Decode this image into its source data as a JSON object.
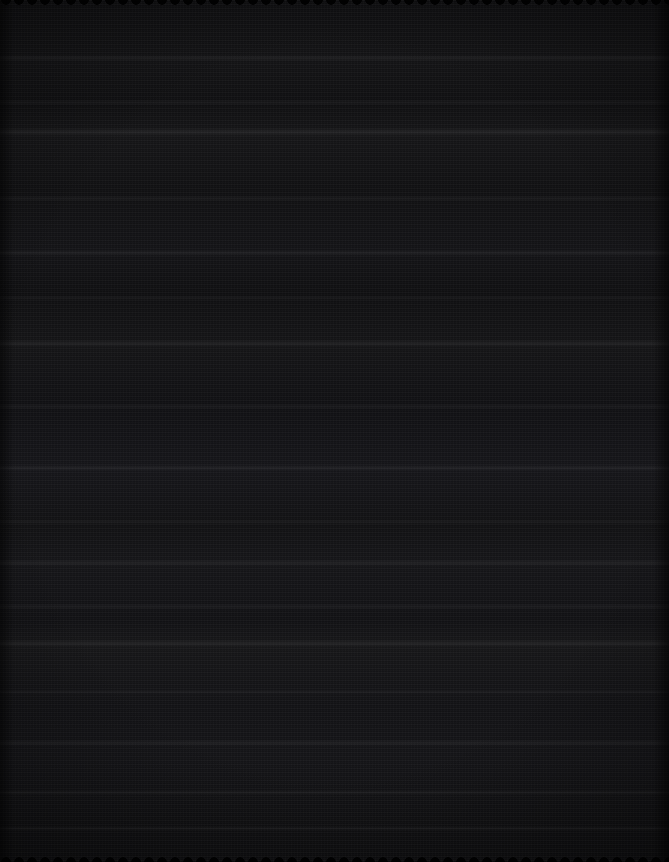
{
  "canvas": {
    "width": 669,
    "height": 862,
    "description": "Near-black scanned surface with horizontal scanline texture",
    "base_color": "#111113",
    "darkest_color": "#0d0d0e",
    "lightest_color": "#1a1a1e",
    "content_text": "",
    "legible_content": "none"
  },
  "texture": {
    "type": "horizontal-scanline-noise",
    "scanline_period_px": 2,
    "vertical_grain_period_px": 3
  },
  "bands": [
    {
      "name": "band-1",
      "top": 55,
      "height": 6,
      "opacity": 0.05
    },
    {
      "name": "band-2",
      "top": 100,
      "height": 5,
      "opacity": 0.04
    },
    {
      "name": "band-3",
      "top": 128,
      "height": 8,
      "opacity": 0.06
    },
    {
      "name": "band-4",
      "top": 196,
      "height": 5,
      "opacity": 0.04
    },
    {
      "name": "band-5",
      "top": 250,
      "height": 6,
      "opacity": 0.05
    },
    {
      "name": "band-6",
      "top": 296,
      "height": 4,
      "opacity": 0.04
    },
    {
      "name": "band-7",
      "top": 340,
      "height": 7,
      "opacity": 0.05
    },
    {
      "name": "band-8",
      "top": 404,
      "height": 5,
      "opacity": 0.04
    },
    {
      "name": "band-9",
      "top": 465,
      "height": 6,
      "opacity": 0.05
    },
    {
      "name": "band-10",
      "top": 520,
      "height": 4,
      "opacity": 0.04
    },
    {
      "name": "band-11",
      "top": 560,
      "height": 6,
      "opacity": 0.05
    },
    {
      "name": "band-12",
      "top": 604,
      "height": 5,
      "opacity": 0.04
    },
    {
      "name": "band-13",
      "top": 640,
      "height": 7,
      "opacity": 0.05
    },
    {
      "name": "band-14",
      "top": 690,
      "height": 4,
      "opacity": 0.04
    },
    {
      "name": "band-15",
      "top": 740,
      "height": 6,
      "opacity": 0.05
    },
    {
      "name": "band-16",
      "top": 790,
      "height": 5,
      "opacity": 0.04
    },
    {
      "name": "band-17",
      "top": 826,
      "height": 5,
      "opacity": 0.04
    }
  ],
  "edges": {
    "top_notch_strip": true,
    "bottom_notch_strip": true,
    "left_vignette": true,
    "right_vignette": true
  }
}
